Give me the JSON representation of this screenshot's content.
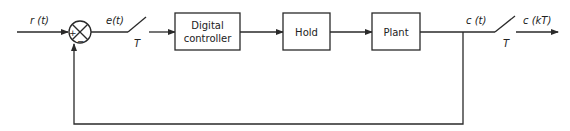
{
  "diagram": {
    "type": "block-diagram",
    "title": "",
    "signals": {
      "input": "r (t)",
      "error": "e(t)",
      "output": "c (t)",
      "sampled_output": "c (kT)"
    },
    "samplers": [
      {
        "id": "sampler-error",
        "period_label": "T"
      },
      {
        "id": "sampler-output",
        "period_label": "T"
      }
    ],
    "summing_junction": {
      "plus_sign": "+",
      "minus_sign": "−"
    },
    "blocks": [
      {
        "id": "digital-controller",
        "line1": "Digital",
        "line2": "controller"
      },
      {
        "id": "hold",
        "label": "Hold"
      },
      {
        "id": "plant",
        "label": "Plant"
      }
    ],
    "feedback": {
      "from": "c (t)",
      "to": "summing-junction",
      "sign": "−"
    },
    "colors": {
      "line": "#2a2a2a",
      "text": "#222222",
      "background": "#ffffff"
    }
  }
}
